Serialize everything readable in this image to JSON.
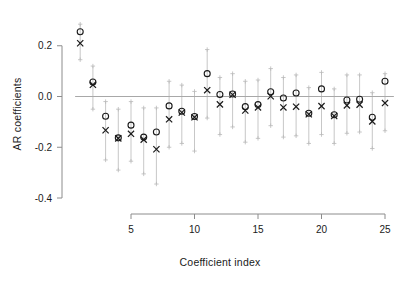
{
  "chart_data": {
    "type": "scatter",
    "title": "",
    "xlabel": "Coefficient index",
    "ylabel": "AR coefficients",
    "xlim": [
      0.3,
      25.7
    ],
    "ylim": [
      -0.44,
      0.285
    ],
    "grid": false,
    "legend": null,
    "zero_line": 0.0,
    "x_ticks": [
      5,
      10,
      15,
      20,
      25
    ],
    "x_tick_labels": [
      "5",
      "10",
      "15",
      "20",
      "25"
    ],
    "y_ticks": [
      0.2,
      0.0,
      -0.2,
      -0.4
    ],
    "y_tick_labels": [
      "0.2",
      "0.0",
      "-0.2",
      "-0.4"
    ],
    "x": [
      1,
      2,
      3,
      4,
      5,
      6,
      7,
      8,
      9,
      10,
      11,
      12,
      13,
      14,
      15,
      16,
      17,
      18,
      19,
      20,
      21,
      22,
      23,
      24,
      25
    ],
    "series": [
      {
        "name": "circle",
        "marker": "o",
        "color": "#1a1a1a",
        "values": [
          0.255,
          0.057,
          -0.078,
          -0.163,
          -0.113,
          -0.16,
          -0.14,
          -0.037,
          -0.058,
          -0.079,
          0.09,
          0.008,
          0.01,
          -0.04,
          -0.032,
          0.019,
          -0.006,
          0.014,
          -0.066,
          0.03,
          -0.072,
          -0.014,
          -0.011,
          -0.082,
          0.06
        ]
      },
      {
        "name": "cross",
        "marker": "x",
        "color": "#1a1a1a",
        "values": [
          0.21,
          0.046,
          -0.133,
          -0.165,
          -0.147,
          -0.17,
          -0.208,
          -0.09,
          -0.063,
          -0.082,
          0.025,
          -0.031,
          0.007,
          -0.055,
          -0.043,
          0.001,
          -0.043,
          -0.04,
          -0.07,
          -0.038,
          -0.077,
          -0.035,
          -0.032,
          -0.098,
          -0.026
        ]
      }
    ],
    "error_bars": {
      "marker": "+",
      "color": "#b9b9b9",
      "lower": [
        0.145,
        -0.05,
        -0.25,
        -0.29,
        -0.255,
        -0.305,
        -0.345,
        -0.2,
        -0.185,
        -0.215,
        -0.085,
        -0.15,
        -0.12,
        -0.18,
        -0.165,
        -0.115,
        -0.16,
        -0.155,
        -0.185,
        -0.15,
        -0.185,
        -0.145,
        -0.14,
        -0.205,
        -0.135
      ],
      "upper": [
        0.285,
        0.12,
        -0.02,
        -0.05,
        -0.02,
        -0.045,
        -0.045,
        0.06,
        0.045,
        0.02,
        0.185,
        0.075,
        0.09,
        0.06,
        0.065,
        0.11,
        0.075,
        0.085,
        0.035,
        0.095,
        0.03,
        0.085,
        0.085,
        0.015,
        0.09
      ]
    }
  },
  "axes": {
    "x_axis_color": "#8c8c8c",
    "y_axis_color": "#8c8c8c",
    "zero_line_color": "#a8a8a8",
    "tick_color": "#8c8c8c"
  }
}
